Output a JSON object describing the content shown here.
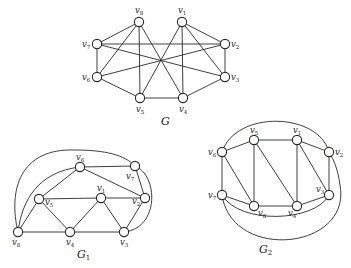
{
  "figure": {
    "graphs": [
      {
        "id": "G",
        "caption": "G",
        "caption_sub": "",
        "caption_pos": [
          161,
          125
        ],
        "nodes": [
          {
            "id": "v1",
            "x": 182,
            "y": 22,
            "lx": 178,
            "ly": 13
          },
          {
            "id": "v2",
            "x": 225,
            "y": 44,
            "lx": 231,
            "ly": 47
          },
          {
            "id": "v3",
            "x": 225,
            "y": 77,
            "lx": 231,
            "ly": 80
          },
          {
            "id": "v4",
            "x": 183,
            "y": 98,
            "lx": 179,
            "ly": 112
          },
          {
            "id": "v5",
            "x": 140,
            "y": 98,
            "lx": 136,
            "ly": 112
          },
          {
            "id": "v6",
            "x": 97,
            "y": 77,
            "lx": 82,
            "ly": 80
          },
          {
            "id": "v7",
            "x": 97,
            "y": 44,
            "lx": 82,
            "ly": 47
          },
          {
            "id": "v8",
            "x": 139,
            "y": 22,
            "lx": 135,
            "ly": 13
          }
        ],
        "edges": [
          [
            "v8",
            "v7"
          ],
          [
            "v8",
            "v6"
          ],
          [
            "v8",
            "v5"
          ],
          [
            "v8",
            "v4"
          ],
          [
            "v1",
            "v2"
          ],
          [
            "v1",
            "v3"
          ],
          [
            "v1",
            "v5"
          ],
          [
            "v1",
            "v4"
          ],
          [
            "v7",
            "v2"
          ],
          [
            "v7",
            "v3"
          ],
          [
            "v6",
            "v2"
          ],
          [
            "v7",
            "v6"
          ],
          [
            "v2",
            "v3"
          ],
          [
            "v6",
            "v5"
          ],
          [
            "v5",
            "v4"
          ],
          [
            "v4",
            "v3"
          ]
        ],
        "arcs": []
      },
      {
        "id": "G1",
        "caption": "G",
        "caption_sub": "1",
        "caption_pos": [
          77,
          258
        ],
        "nodes": [
          {
            "id": "v1",
            "x": 101,
            "y": 198,
            "lx": 97,
            "ly": 191
          },
          {
            "id": "v2",
            "x": 145,
            "y": 198,
            "lx": 132,
            "ly": 204
          },
          {
            "id": "v3",
            "x": 124,
            "y": 232,
            "lx": 120,
            "ly": 245
          },
          {
            "id": "v4",
            "x": 70,
            "y": 232,
            "lx": 66,
            "ly": 245
          },
          {
            "id": "v5",
            "x": 39,
            "y": 199,
            "lx": 45,
            "ly": 205
          },
          {
            "id": "v6",
            "x": 80,
            "y": 167,
            "lx": 76,
            "ly": 160
          },
          {
            "id": "v7",
            "x": 135,
            "y": 166,
            "lx": 126,
            "ly": 179
          },
          {
            "id": "v8",
            "x": 18,
            "y": 232,
            "lx": 12,
            "ly": 245
          }
        ],
        "edges": [
          [
            "v6",
            "v7"
          ],
          [
            "v6",
            "v5"
          ],
          [
            "v6",
            "v2"
          ],
          [
            "v7",
            "v2"
          ],
          [
            "v5",
            "v1"
          ],
          [
            "v1",
            "v2"
          ],
          [
            "v5",
            "v8"
          ],
          [
            "v5",
            "v4"
          ],
          [
            "v1",
            "v4"
          ],
          [
            "v1",
            "v3"
          ],
          [
            "v2",
            "v3"
          ],
          [
            "v8",
            "v4"
          ],
          [
            "v4",
            "v3"
          ]
        ],
        "arcs": [
          {
            "from": "v8",
            "to": "v7",
            "d": "M18,232 C8,190 20,148 75,150 C105,150 125,155 135,166"
          },
          {
            "from": "v8",
            "to": "v6",
            "d": "M18,232 C22,200 38,172 80,167"
          },
          {
            "from": "v7",
            "to": "v3",
            "d": "M135,166 C158,175 160,228 124,232"
          }
        ]
      },
      {
        "id": "G2",
        "caption": "G",
        "caption_sub": "2",
        "caption_pos": [
          259,
          253
        ],
        "nodes": [
          {
            "id": "v1",
            "x": 297,
            "y": 140,
            "lx": 293,
            "ly": 133
          },
          {
            "id": "v2",
            "x": 329,
            "y": 152,
            "lx": 335,
            "ly": 155
          },
          {
            "id": "v3",
            "x": 329,
            "y": 195,
            "lx": 316,
            "ly": 192
          },
          {
            "id": "v4",
            "x": 297,
            "y": 206,
            "lx": 288,
            "ly": 216
          },
          {
            "id": "v5",
            "x": 254,
            "y": 140,
            "lx": 250,
            "ly": 133
          },
          {
            "id": "v6",
            "x": 222,
            "y": 152,
            "lx": 208,
            "ly": 155
          },
          {
            "id": "v7",
            "x": 222,
            "y": 195,
            "lx": 208,
            "ly": 198
          },
          {
            "id": "v8",
            "x": 254,
            "y": 206,
            "lx": 258,
            "ly": 216
          }
        ],
        "edges": [
          [
            "v6",
            "v5"
          ],
          [
            "v5",
            "v1"
          ],
          [
            "v1",
            "v2"
          ],
          [
            "v6",
            "v7"
          ],
          [
            "v2",
            "v3"
          ],
          [
            "v7",
            "v8"
          ],
          [
            "v8",
            "v4"
          ],
          [
            "v4",
            "v3"
          ],
          [
            "v6",
            "v8"
          ],
          [
            "v5",
            "v8"
          ],
          [
            "v5",
            "v4"
          ],
          [
            "v1",
            "v4"
          ],
          [
            "v1",
            "v3"
          ]
        ],
        "arcs": [
          {
            "from": "v6",
            "to": "v2",
            "d": "M222,152 C236,110 318,112 329,152"
          },
          {
            "from": "v7",
            "to": "v3",
            "d": "M222,195 C240,225 315,222 329,195"
          },
          {
            "from": "v7",
            "to": "v2",
            "d": "M222,195 C232,262 352,250 340,185 C338,170 334,160 329,152"
          }
        ]
      }
    ]
  }
}
